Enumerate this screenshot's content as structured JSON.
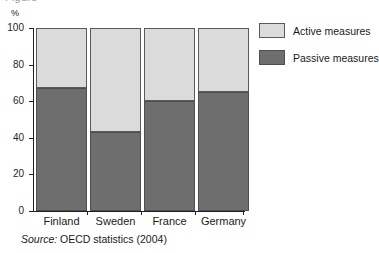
{
  "figure": {
    "title_fragment": "Figure",
    "unit_label": "%",
    "source_prefix": "Source:",
    "source_text": "OECD statistics (2004)"
  },
  "legend": {
    "position": "right",
    "items": [
      {
        "label": "Active measures",
        "color": "#dbdbdb",
        "key": "active"
      },
      {
        "label": "Passive measures",
        "color": "#6e6e6e",
        "key": "passive"
      }
    ]
  },
  "axis": {
    "y_ticks": [
      "0",
      "20",
      "40",
      "60",
      "80",
      "100"
    ]
  },
  "chart_data": {
    "type": "bar",
    "stacked": true,
    "title": "",
    "subtitle": "",
    "xlabel": "",
    "ylabel": "%",
    "ylim": [
      0,
      100
    ],
    "yticks": [
      0,
      20,
      40,
      60,
      80,
      100
    ],
    "grid": false,
    "legend_position": "right",
    "categories": [
      "Finland",
      "Sweden",
      "France",
      "Germany"
    ],
    "series": [
      {
        "name": "Passive measures",
        "color": "#6e6e6e",
        "values": [
          67,
          43,
          60,
          65
        ]
      },
      {
        "name": "Active measures",
        "color": "#dbdbdb",
        "values": [
          33,
          57,
          40,
          35
        ]
      }
    ],
    "annotations": []
  }
}
